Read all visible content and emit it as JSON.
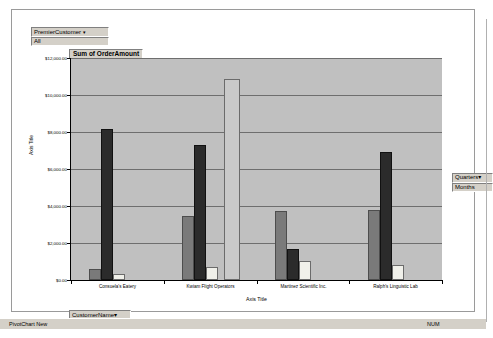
{
  "window": {
    "status_text": "PivotChart New",
    "status_indicator": "NUM"
  },
  "page_filter": {
    "field_label": "PremierCustomer",
    "caret": "▾",
    "value": "All"
  },
  "column_filter": {
    "field_label": "Quarters",
    "caret": "▾",
    "value": "Months"
  },
  "row_filter": {
    "field_label": "CustomerName",
    "caret": "▾"
  },
  "chart_data": {
    "type": "bar",
    "title": "Sum of OrderAmount",
    "xlabel": "Axis Title",
    "ylabel": "Axis Title",
    "ylim": [
      0,
      12000
    ],
    "grid": true,
    "legend_position": "none",
    "ytick_labels": [
      "$12,000.00",
      "$10,000.00",
      "$8,000.00",
      "$6,000.00",
      "$4,000.00",
      "$2,000.00",
      "$0.00"
    ],
    "ytick_values": [
      12000,
      10000,
      8000,
      6000,
      4000,
      2000,
      0
    ],
    "categories": [
      "Consuela's Eatery",
      "Kwiam Flight Operators",
      "Martinez Scientific Inc.",
      "Ralph's Linguistic Lab"
    ],
    "series": [
      {
        "name": "Series 1",
        "color": "#7a7a7a",
        "values": [
          600,
          3450,
          3750,
          3800
        ]
      },
      {
        "name": "Series 2",
        "color": "#2b2b2b",
        "values": [
          8150,
          7300,
          1700,
          6900
        ]
      },
      {
        "name": "Series 3",
        "color": "#f0f0ea",
        "values": [
          300,
          700,
          1050,
          800
        ]
      }
    ],
    "extra_series": [
      {
        "name": "Series 4",
        "color": "#c9c9c9",
        "category": "Kwiam Flight Operators",
        "value": 10850
      }
    ]
  }
}
